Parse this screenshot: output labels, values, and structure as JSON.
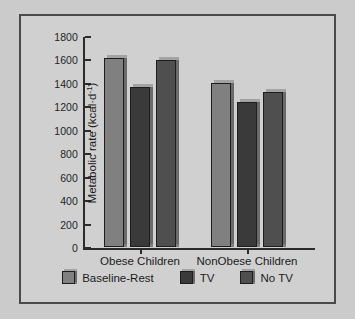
{
  "chart_data": {
    "type": "bar",
    "title": "",
    "subtitle": "",
    "xlabel": "",
    "ylabel": "Metabolic rate (kcal·d⁻¹)",
    "ylabel_parts": {
      "main": "Metabolic rate (kcal·d",
      "exponent": "-1",
      "tail": ")"
    },
    "categories": [
      "Obese Children",
      "NonObese Children"
    ],
    "series": [
      {
        "name": "Baseline-Rest",
        "color": "#808080",
        "values": [
          1610,
          1400
        ]
      },
      {
        "name": "TV",
        "color": "#3a3a3a",
        "values": [
          1365,
          1240
        ]
      },
      {
        "name": "No TV",
        "color": "#4f4f4f",
        "values": [
          1595,
          1325
        ]
      }
    ],
    "ylim": [
      0,
      1800
    ],
    "y_ticks": [
      1800,
      1600,
      1400,
      1200,
      1000,
      800,
      600,
      400,
      200,
      0
    ],
    "y_tick_labels": [
      "1800",
      "1600",
      "1400",
      "1200",
      "1000",
      "800",
      "600",
      "400",
      "200",
      "0"
    ],
    "grid": false,
    "legend_position": "bottom",
    "annotations": []
  },
  "figure": {
    "background_color": "#cbcbcb",
    "panel_color": "#d0d0d0",
    "border_color": "#4a4a4a"
  }
}
